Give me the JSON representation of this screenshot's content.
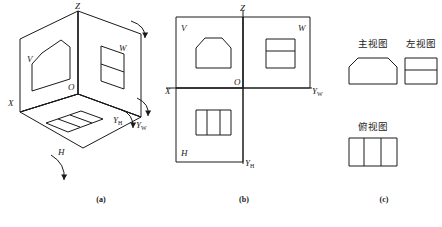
{
  "figure": {
    "caption_a": "(a)",
    "caption_b": "(b)",
    "caption_c": "(c)"
  },
  "panel_a": {
    "title": "three-projection-plane-box",
    "labels": {
      "z": "Z",
      "x": "X",
      "o": "O",
      "v": "V",
      "w": "W",
      "h": "H",
      "y_w": "Y",
      "y_w_sub": "W",
      "y_h": "Y",
      "y_h_sub": "H"
    }
  },
  "panel_b": {
    "title": "unfolded-projection-planes",
    "labels": {
      "z": "Z",
      "x": "X",
      "o": "O",
      "v": "V",
      "w": "W",
      "h": "H",
      "y_w": "Y",
      "y_w_sub": "W",
      "y_h": "Y",
      "y_h_sub": "H"
    }
  },
  "panel_c": {
    "title": "three-standard-views",
    "front_view_label": "主视图",
    "left_view_label": "左视图",
    "top_view_label": "俯视图"
  },
  "colors": {
    "line": "#1a1a1a",
    "background": "#ffffff"
  }
}
